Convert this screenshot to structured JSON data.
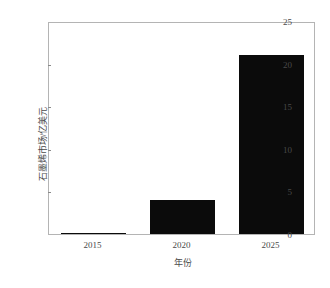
{
  "chart_data": {
    "type": "bar",
    "title": "",
    "subtitle": "",
    "categories": [
      "2015",
      "2020",
      "2025"
    ],
    "values": [
      0.1,
      4.0,
      21.0
    ],
    "xlabel": "年份",
    "ylabel": "石墨烯市场/亿美元",
    "xlim": [
      0,
      3
    ],
    "ylim": [
      0,
      25
    ],
    "yticks": [
      0,
      5,
      10,
      15,
      20,
      25
    ],
    "ytick_labels": [
      "0",
      "5",
      "10",
      "15",
      "20",
      "25"
    ],
    "xtick_labels": [
      "2015",
      "2020",
      "2025"
    ],
    "grid": false,
    "legend": null,
    "bar_color": "#0b0b0b",
    "frame_color": "#b4b4b4",
    "background_color": "#ffffff",
    "text_color": "#4a4a4a",
    "annotations": []
  },
  "axes": {
    "y_ticks": [
      {
        "label": "25",
        "value": 25
      },
      {
        "label": "20",
        "value": 20
      },
      {
        "label": "15",
        "value": 15
      },
      {
        "label": "10",
        "value": 10
      },
      {
        "label": "5",
        "value": 5
      },
      {
        "label": "0",
        "value": 0
      }
    ],
    "x_ticks": [
      {
        "label": "2015"
      },
      {
        "label": "2020"
      },
      {
        "label": "2025"
      }
    ],
    "y_title": "石墨烯市场/亿美元",
    "x_title": "年份"
  }
}
